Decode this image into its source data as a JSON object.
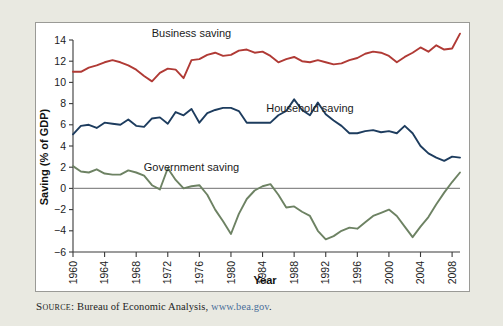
{
  "figure": {
    "background_color": "#e9e9e1",
    "plot_background_color": "#ffffff",
    "frame_border_color": "#9a9a96"
  },
  "source": {
    "label": "Source:",
    "text": " Bureau of Economic Analysis, ",
    "link": "www.bea.gov",
    "trailing": "."
  },
  "chart_data": {
    "type": "line",
    "title": "",
    "xlabel": "Year",
    "ylabel": "Saving (% of GDP)",
    "xlim": [
      1960,
      2009
    ],
    "ylim": [
      -6,
      14
    ],
    "grid": false,
    "legend_position": "inline-annotations",
    "yticks": [
      -6,
      -4,
      -2,
      0,
      2,
      4,
      6,
      8,
      10,
      12,
      14
    ],
    "ytick_labels": [
      "−6",
      "−4",
      "−2",
      "0",
      "2",
      "4",
      "6",
      "8",
      "10",
      "12",
      "14"
    ],
    "xticks": [
      1960,
      1964,
      1968,
      1972,
      1976,
      1980,
      1984,
      1988,
      1992,
      1996,
      2000,
      2004,
      2008
    ],
    "xtick_labels": [
      "1960",
      "1964",
      "1968",
      "1972",
      "1976",
      "1980",
      "1984",
      "1988",
      "1992",
      "1996",
      "2000",
      "2004",
      "2008"
    ],
    "zero_line": 0,
    "x": [
      1960,
      1961,
      1962,
      1963,
      1964,
      1965,
      1966,
      1967,
      1968,
      1969,
      1970,
      1971,
      1972,
      1973,
      1974,
      1975,
      1976,
      1977,
      1978,
      1979,
      1980,
      1981,
      1982,
      1983,
      1984,
      1985,
      1986,
      1987,
      1988,
      1989,
      1990,
      1991,
      1992,
      1993,
      1994,
      1995,
      1996,
      1997,
      1998,
      1999,
      2000,
      2001,
      2002,
      2003,
      2004,
      2005,
      2006,
      2007,
      2008,
      2009
    ],
    "series": [
      {
        "name": "Business saving",
        "color": "#b03a35",
        "label_text": "Business saving",
        "values": [
          11.0,
          11.0,
          11.4,
          11.6,
          11.9,
          12.1,
          11.9,
          11.6,
          11.2,
          10.6,
          10.1,
          10.9,
          11.3,
          11.2,
          10.4,
          12.1,
          12.2,
          12.6,
          12.8,
          12.5,
          12.6,
          13.0,
          13.1,
          12.8,
          12.9,
          12.5,
          11.9,
          12.2,
          12.4,
          12.0,
          11.9,
          12.1,
          11.9,
          11.7,
          11.8,
          12.1,
          12.3,
          12.7,
          12.9,
          12.8,
          12.5,
          11.9,
          12.4,
          12.8,
          13.3,
          12.9,
          13.5,
          13.1,
          13.2,
          14.6
        ]
      },
      {
        "name": "Household saving",
        "color": "#1d3c5e",
        "label_text": "Household saving",
        "values": [
          5.1,
          5.9,
          6.0,
          5.7,
          6.2,
          6.1,
          6.0,
          6.5,
          5.9,
          5.8,
          6.6,
          6.7,
          6.1,
          7.2,
          6.9,
          7.5,
          6.2,
          7.1,
          7.4,
          7.6,
          7.6,
          7.3,
          6.2,
          6.2,
          6.2,
          6.2,
          6.9,
          7.3,
          8.4,
          7.4,
          6.9,
          8.1,
          7.0,
          6.4,
          5.9,
          5.2,
          5.2,
          5.4,
          5.5,
          5.3,
          5.4,
          5.2,
          5.9,
          5.2,
          4.0,
          3.3,
          2.9,
          2.6,
          3.0,
          2.9
        ]
      },
      {
        "name": "Government saving",
        "color": "#6d8263",
        "label_text": "Government saving",
        "values": [
          2.1,
          1.6,
          1.5,
          1.8,
          1.4,
          1.3,
          1.3,
          1.7,
          1.5,
          1.2,
          0.3,
          -0.1,
          1.9,
          0.8,
          0.0,
          0.2,
          0.3,
          -0.6,
          -2.0,
          -3.1,
          -4.3,
          -2.4,
          -1.0,
          -0.2,
          0.2,
          0.4,
          -0.6,
          -1.8,
          -1.7,
          -2.2,
          -2.6,
          -4.0,
          -4.8,
          -4.5,
          -4.0,
          -3.7,
          -3.8,
          -3.2,
          -2.6,
          -2.3,
          -2.0,
          -2.6,
          -3.6,
          -4.6,
          -3.6,
          -2.7,
          -1.5,
          -0.4,
          0.6,
          1.5
        ]
      }
    ],
    "annotations": [
      {
        "text": "Business saving",
        "x": 1975,
        "y": 14.3
      },
      {
        "text": "Household saving",
        "x": 1990,
        "y": 7.2
      },
      {
        "text": "Government saving",
        "x": 1975,
        "y": 1.6
      }
    ]
  }
}
